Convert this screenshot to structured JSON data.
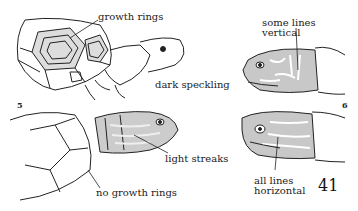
{
  "figures": [
    {
      "number": "5",
      "labels": {
        "growth_rings": "growth rings",
        "dark_speckling": "dark speckling",
        "light_streaks": "light streaks",
        "no_growth_rings": "no growth rings"
      }
    },
    {
      "number": "6",
      "labels": {
        "vertical_line1": "some lines",
        "vertical_line2": "vertical",
        "horizontal_line1": "all lines",
        "horizontal_line2": "horizontal"
      }
    }
  ],
  "page_number": "41",
  "colors": {
    "ink": "#222222",
    "shading": "#c8c8c8"
  }
}
